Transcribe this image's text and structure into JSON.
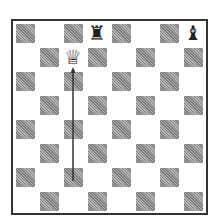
{
  "diagram": {
    "type": "chess-board",
    "files": [
      "a",
      "b",
      "c",
      "d",
      "e",
      "f",
      "g",
      "h"
    ],
    "ranks": [
      8,
      7,
      6,
      5,
      4,
      3,
      2,
      1
    ],
    "orientation": "white-bottom",
    "colors": {
      "border": "#333333",
      "light_square": "#ffffff",
      "dark_square": "#9a9a9a"
    },
    "pieces": [
      {
        "square": "d8",
        "piece": "rook",
        "color": "black",
        "glyph": "♜"
      },
      {
        "square": "h8",
        "piece": "bishop",
        "color": "black",
        "glyph": "♝"
      },
      {
        "square": "c7",
        "piece": "queen",
        "color": "white",
        "glyph": "♕"
      }
    ],
    "arrows": [
      {
        "from": "c2",
        "to": "c7",
        "color": "#333333"
      }
    ]
  }
}
